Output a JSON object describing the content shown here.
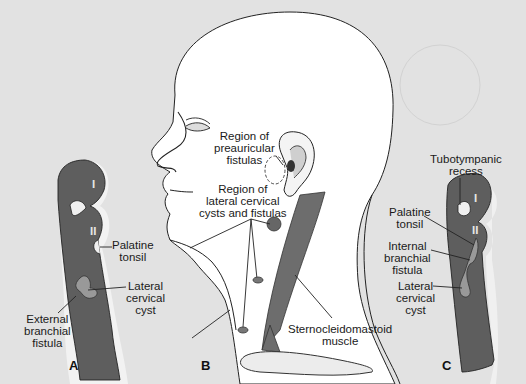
{
  "figure": {
    "panels": [
      {
        "letter": "A",
        "labels": [
          "Palatine tonsil",
          "Lateral cervical cyst",
          "External branchial fistula"
        ],
        "arch_numerals": [
          "I",
          "II"
        ]
      },
      {
        "letter": "B",
        "labels": [
          "Region of preauricular fistulas",
          "Region of lateral cervical cysts and fistulas",
          "Sternocleidomastoid muscle"
        ]
      },
      {
        "letter": "C",
        "labels": [
          "Tubotympanic recess",
          "Palatine tonsil",
          "Internal branchial fistula",
          "Lateral cervical cyst"
        ],
        "arch_numerals": [
          "I",
          "II"
        ]
      }
    ],
    "colors": {
      "background": "#e2e2e2",
      "head": "#ffffff",
      "tissue": "#6a6a6a",
      "cyst": "#9a9a9a",
      "outline": "#222222"
    }
  },
  "a": {
    "letter": "A",
    "numeral_1": "I",
    "numeral_2": "II",
    "palatine_1": "Palatine",
    "palatine_2": "tonsil",
    "lateral_1": "Lateral",
    "lateral_2": "cervical",
    "lateral_3": "cyst",
    "external_1": "External",
    "external_2": "branchial",
    "external_3": "fistula"
  },
  "b": {
    "letter": "B",
    "preauricular_1": "Region of",
    "preauricular_2": "preauricular",
    "preauricular_3": "fistulas",
    "lateral_1": "Region of",
    "lateral_2": "lateral cervical",
    "lateral_3": "cysts and fistulas",
    "scm_1": "Sternocleidomastoid",
    "scm_2": "muscle"
  },
  "c": {
    "letter": "C",
    "numeral_1": "I",
    "numeral_2": "II",
    "tubo_1": "Tubotympanic",
    "tubo_2": "recess",
    "palatine_1": "Palatine",
    "palatine_2": "tonsil",
    "internal_1": "Internal",
    "internal_2": "branchial",
    "internal_3": "fistula",
    "lateral_1": "Lateral",
    "lateral_2": "cervical",
    "lateral_3": "cyst"
  }
}
